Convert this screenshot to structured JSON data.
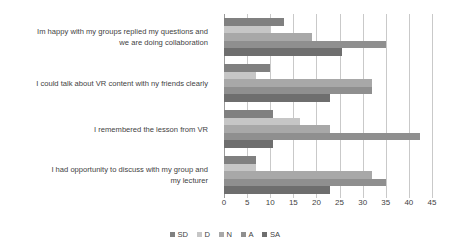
{
  "chart_data": {
    "type": "bar",
    "orientation": "horizontal",
    "title": "",
    "subtitle": "",
    "xlabel": "",
    "ylabel": "",
    "xlim": [
      0,
      45
    ],
    "xticks": [
      0,
      5,
      10,
      15,
      20,
      25,
      30,
      35,
      40,
      45
    ],
    "grid": true,
    "legend_position": "bottom",
    "categories": [
      "Im happy with my groups replied my questions and we are doing collaboration",
      "I could talk about VR content with ny friends clearly",
      "I remembered the lesson from VR",
      "I had opportunity to discuss with my group and my lecturer"
    ],
    "category_lines": [
      [
        "Im happy with my groups replied my questions and",
        "we are doing collaboration"
      ],
      [
        "I could talk about VR content with ny friends clearly"
      ],
      [
        "I remembered the lesson from VR"
      ],
      [
        "I had opportunity to discuss with my group and",
        "my lecturer"
      ]
    ],
    "series": [
      {
        "name": "SD",
        "color": "#808080",
        "values": [
          13,
          10,
          10.5,
          7
        ]
      },
      {
        "name": "D",
        "color": "#c6c6c6",
        "values": [
          10,
          7,
          16.5,
          7
        ]
      },
      {
        "name": "N",
        "color": "#a8a8a8",
        "values": [
          19,
          32,
          23,
          32
        ]
      },
      {
        "name": "A",
        "color": "#8f8f8f",
        "values": [
          35,
          32,
          42.5,
          35
        ]
      },
      {
        "name": "SA",
        "color": "#6e6e6e",
        "values": [
          25.5,
          23,
          10.5,
          23
        ]
      }
    ],
    "legend": [
      {
        "label": "SD",
        "color": "#808080"
      },
      {
        "label": "D",
        "color": "#c6c6c6"
      },
      {
        "label": "N",
        "color": "#a8a8a8"
      },
      {
        "label": "A",
        "color": "#8f8f8f"
      },
      {
        "label": "SA",
        "color": "#6e6e6e"
      }
    ]
  }
}
